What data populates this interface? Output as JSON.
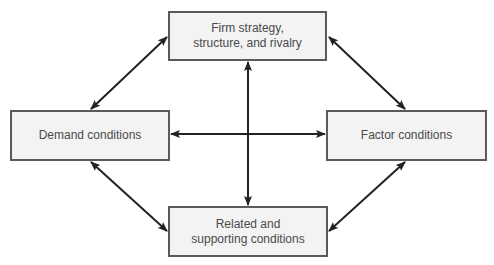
{
  "diagram": {
    "type": "diamond-model",
    "nodes": [
      {
        "id": "top",
        "label": "Firm strategy,\nstructure, and rivalry"
      },
      {
        "id": "left",
        "label": "Demand conditions"
      },
      {
        "id": "right",
        "label": "Factor conditions"
      },
      {
        "id": "bottom",
        "label": "Related and\nsupporting conditions"
      }
    ],
    "edges": [
      {
        "from": "top",
        "to": "left",
        "style": "double-arrow"
      },
      {
        "from": "top",
        "to": "right",
        "style": "double-arrow"
      },
      {
        "from": "left",
        "to": "bottom",
        "style": "double-arrow"
      },
      {
        "from": "right",
        "to": "bottom",
        "style": "double-arrow"
      },
      {
        "from": "top",
        "to": "bottom",
        "style": "double-arrow"
      },
      {
        "from": "left",
        "to": "right",
        "style": "double-arrow"
      }
    ],
    "colors": {
      "box_fill": "#f3f3f3",
      "box_border": "#5a5a5a",
      "text": "#4a4a4a",
      "arrow": "#222222"
    }
  }
}
